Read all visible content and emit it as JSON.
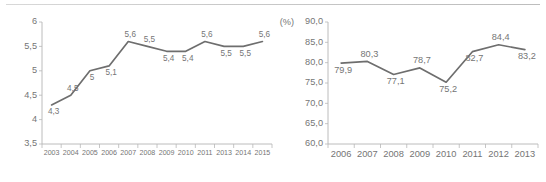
{
  "page": {
    "background_color": "#ffffff",
    "line_color": "#6e6e6e",
    "axis_color": "#b4b4b4",
    "text_color": "#757575",
    "top_rule_color": "#c9c9c9"
  },
  "chart_data": [
    {
      "id": "left",
      "type": "line",
      "title": "",
      "xlabel": "",
      "ylabel": "",
      "unit_label": "",
      "categories": [
        "2003",
        "2004",
        "2005",
        "2006",
        "2007",
        "2008",
        "2009",
        "2010",
        "2011",
        "2013",
        "2014",
        "2015"
      ],
      "values": [
        4.3,
        4.5,
        5.0,
        5.1,
        5.6,
        5.5,
        5.4,
        5.4,
        5.6,
        5.5,
        5.5,
        5.6
      ],
      "value_labels": [
        "4,3",
        "4,5",
        "5",
        "5,1",
        "5,6",
        "5,5",
        "5,4",
        "5,4",
        "5,6",
        "5,5",
        "5,5",
        "5,6"
      ],
      "label_positions": [
        "below",
        "above",
        "below",
        "below",
        "above",
        "above",
        "below",
        "below",
        "above",
        "below",
        "below",
        "above"
      ],
      "ylim": [
        3.5,
        6.0
      ],
      "ytick_values": [
        6.0,
        5.5,
        5.0,
        4.5,
        4.0,
        3.5
      ],
      "ytick_labels": [
        "6",
        "5,5",
        "5",
        "4,5",
        "4",
        "3,5"
      ],
      "grid": false,
      "legend": "none"
    },
    {
      "id": "right",
      "type": "line",
      "title": "",
      "xlabel": "",
      "ylabel": "",
      "unit_label": "(%)",
      "categories": [
        "2006",
        "2007",
        "2008",
        "2009",
        "2010",
        "2011",
        "2012",
        "2013"
      ],
      "values": [
        79.9,
        80.3,
        77.1,
        78.7,
        75.2,
        82.7,
        84.4,
        83.2
      ],
      "value_labels": [
        "79,9",
        "80,3",
        "77,1",
        "78,7",
        "75,2",
        "82,7",
        "84,4",
        "83,2"
      ],
      "label_positions": [
        "below",
        "above",
        "below",
        "above",
        "below",
        "below",
        "above",
        "below"
      ],
      "ylim": [
        60.0,
        90.0
      ],
      "ytick_values": [
        90.0,
        85.0,
        80.0,
        75.0,
        70.0,
        65.0,
        60.0
      ],
      "ytick_labels": [
        "90,0",
        "85,0",
        "80,0",
        "75,0",
        "70,0",
        "65,0",
        "60,0"
      ],
      "grid": false,
      "legend": "none"
    }
  ]
}
